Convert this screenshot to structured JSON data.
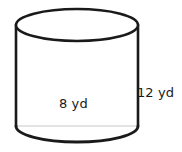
{
  "figure": {
    "name": "cylinder",
    "shape_type": "cylinder",
    "background_color": "#ffffff",
    "outline_color": "#1a1a1a",
    "hidden_edge_color": "#c8c8c8",
    "label_color": "#1a1a1a"
  },
  "labels": {
    "diameter": "8 yd",
    "height": "12 yd"
  },
  "measurements": {
    "diameter_value": 8,
    "diameter_unit": "yd",
    "height_value": 12,
    "height_unit": "yd"
  },
  "geometry": {
    "left_x": 16,
    "right_x": 138,
    "top_center_y": 25,
    "bottom_center_y": 126,
    "ellipse_rx": 61,
    "ellipse_ry": 16,
    "stroke_width": 2.6
  }
}
